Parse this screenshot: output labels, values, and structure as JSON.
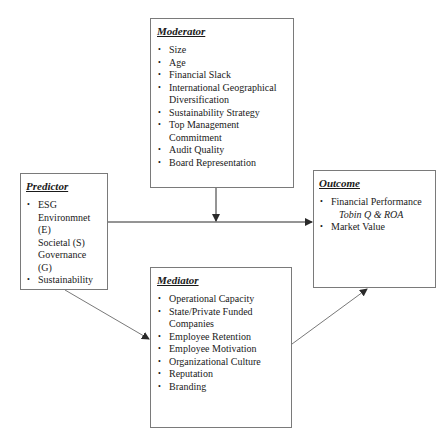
{
  "moderator": {
    "title": "Moderator",
    "items": [
      "Size",
      "Age",
      "Financial Slack",
      "International Geographical",
      "Diversification",
      "Sustainability Strategy",
      "Top Management Commitment",
      "Audit Quality",
      "Board Representation"
    ]
  },
  "predictor": {
    "title": "Predictor",
    "items": [
      "ESG",
      "Environmnet (E)",
      "Societal (S)",
      "Governance (G)",
      "Sustainability"
    ]
  },
  "outcome": {
    "title": "Outcome",
    "items": [
      "Financial Performance",
      "Tobin Q & ROA",
      "Market Value"
    ]
  },
  "mediator": {
    "title": "Mediator",
    "items": [
      "Operational Capacity",
      "State/Private Funded",
      "Companies",
      "Employee Retention",
      "Employee Motivation",
      "Organizational Culture",
      "Reputation",
      "Branding"
    ]
  },
  "colors": {
    "border": "#7a7a7a",
    "arrow": "#2a2a2a"
  }
}
